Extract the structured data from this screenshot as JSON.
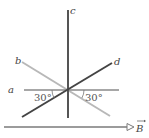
{
  "diagram": {
    "type": "wire-orientations-in-magnetic-field",
    "wires": [
      {
        "label": "a",
        "orientation": "horizontal",
        "color": "#8a8a8a"
      },
      {
        "label": "b",
        "orientation": "diagonal-down-right",
        "color": "#b8b8b8"
      },
      {
        "label": "c",
        "orientation": "vertical",
        "color": "#555555"
      },
      {
        "label": "d",
        "orientation": "diagonal-up-right",
        "color": "#444444"
      }
    ],
    "angles": [
      {
        "label": "30°",
        "between": "a and d",
        "side": "left"
      },
      {
        "label": "30°",
        "between": "a and b",
        "side": "right"
      }
    ],
    "field": {
      "label": "B",
      "vector_symbol": "→",
      "direction": "right",
      "color": "#7a7a7a"
    }
  }
}
